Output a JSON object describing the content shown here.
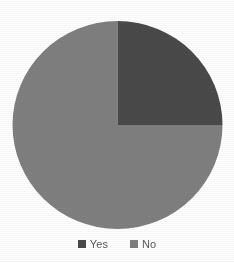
{
  "chart_data": {
    "type": "pie",
    "title": "",
    "subtitle": "",
    "xlabel": "",
    "ylabel": "",
    "categories": [
      "Yes",
      "No"
    ],
    "values": [
      25,
      75
    ],
    "value_unit": "%",
    "slices": [
      {
        "label": "Yes",
        "value": 25,
        "percent": "25%",
        "color": "#4a4a4a",
        "start_angle_deg": 0,
        "end_angle_deg": 90
      },
      {
        "label": "No",
        "value": 75,
        "percent": "75%",
        "color": "#808080",
        "start_angle_deg": 90,
        "end_angle_deg": 360
      }
    ],
    "start_angle_deg": 0,
    "direction": "clockwise",
    "grid": false,
    "data_labels_shown": false,
    "legend": {
      "position": "bottom",
      "entries": [
        {
          "label": "Yes",
          "color": "#4a4a4a",
          "marker": "square-marker"
        },
        {
          "label": "No",
          "color": "#808080",
          "marker": "square-marker"
        }
      ]
    }
  },
  "colors": {
    "background": "#ffffff",
    "slice_yes": "#4a4a4a",
    "slice_no": "#808080",
    "legend_text": "#5b5b5b"
  }
}
